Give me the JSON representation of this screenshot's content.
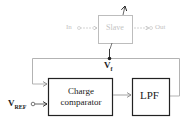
{
  "diagram": {
    "slave_block": {
      "label": "Slave",
      "input_label": "In",
      "output_label": "Out"
    },
    "charge_comparator": {
      "line1": "Charge",
      "line2": "comparator"
    },
    "lpf": {
      "label": "LPF"
    },
    "signals": {
      "feedback": {
        "main": "V",
        "sub": "f"
      },
      "reference": {
        "main": "V",
        "sub": "REF"
      }
    },
    "colors": {
      "dark": "#222222",
      "faint": "#bdbdbd",
      "mid": "#888888"
    }
  }
}
